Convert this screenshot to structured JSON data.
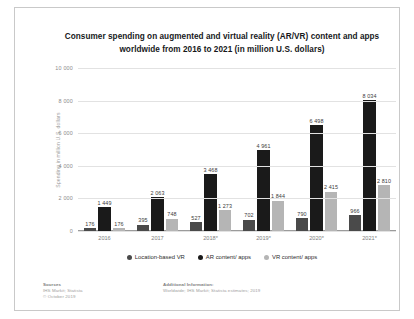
{
  "chart_data": {
    "type": "bar",
    "title": "Consumer spending on augmented and virtual reality (AR/VR) content and apps worldwide from 2016 to 2021 (in million U.S. dollars)",
    "title_line1": "Consumer spending on augmented and virtual reality (AR/VR) content and apps",
    "title_line2": "worldwide from 2016 to 2021 (in million U.S. dollars)",
    "xlabel": "",
    "ylabel": "Spending in million U.S. dollars",
    "ylim": [
      0,
      10000
    ],
    "yticks": [
      0,
      2000,
      4000,
      6000,
      8000,
      10000
    ],
    "ytick_labels": [
      "0",
      "2 000",
      "4 000",
      "6 000",
      "8 000",
      "10 000"
    ],
    "grid": true,
    "legend_position": "bottom",
    "categories": [
      "2016",
      "2017",
      "2018*",
      "2019*",
      "2020*",
      "2021*"
    ],
    "series": [
      {
        "name": "Location-based VR",
        "color": "#4a4a4a",
        "values": [
          176,
          395,
          527,
          702,
          790,
          966
        ],
        "labels": [
          "176",
          "395",
          "527",
          "702",
          "790",
          "966"
        ]
      },
      {
        "name": "AR content/ apps",
        "color": "#1a1a1a",
        "values": [
          1449,
          2063,
          3468,
          4961,
          6498,
          8034
        ],
        "labels": [
          "1 449",
          "2 063",
          "3 468",
          "4 961",
          "6 498",
          "8 034"
        ]
      },
      {
        "name": "VR content/ apps",
        "color": "#b5b5b5",
        "values": [
          176,
          748,
          1273,
          1844,
          2415,
          2810
        ],
        "labels": [
          "176",
          "748",
          "1 273",
          "1 844",
          "2 415",
          "2 810"
        ]
      }
    ]
  },
  "footer": {
    "sources_heading": "Sources",
    "sources_line1": "IHS Markit; Statista",
    "sources_line2": "© October 2019",
    "additional_heading": "Additional Information:",
    "additional_line1": "Worldwide; IHS Markit; Statista estimates; 2019"
  }
}
